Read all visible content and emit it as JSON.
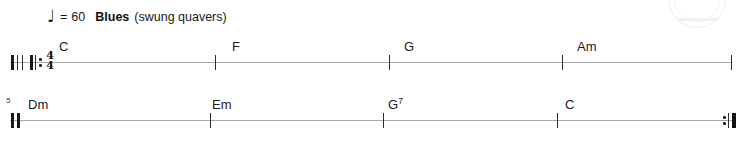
{
  "document": {
    "type": "chord-chart",
    "staff_color": "#a8a8a8",
    "ink_color": "#1a1a1a"
  },
  "tempo": {
    "note_glyph": "♩",
    "note_icon_name": "quarter-note-icon",
    "equals": "=",
    "bpm": "60",
    "style": "Blues",
    "style_note": "(swung quavers)"
  },
  "systems": [
    {
      "id": "system-1",
      "measure_number": "",
      "start_barline": "repeat-start",
      "time_signature": {
        "numerator": "4",
        "denominator": "4"
      },
      "end_barline": "single",
      "chords": [
        {
          "label": "C",
          "quality": ""
        },
        {
          "label": "F",
          "quality": ""
        },
        {
          "label": "G",
          "quality": ""
        },
        {
          "label": "Am",
          "quality": ""
        }
      ]
    },
    {
      "id": "system-2",
      "measure_number": "5",
      "start_barline": "thick",
      "time_signature": null,
      "end_barline": "repeat-end",
      "chords": [
        {
          "label": "Dm",
          "quality": ""
        },
        {
          "label": "Em",
          "quality": ""
        },
        {
          "label": "G",
          "quality": "7"
        },
        {
          "label": "C",
          "quality": ""
        }
      ]
    }
  ]
}
